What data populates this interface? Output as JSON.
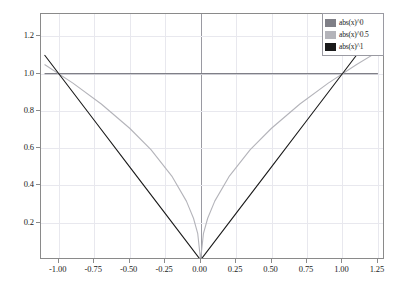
{
  "chart_data": {
    "type": "line",
    "title": "",
    "xlabel": "",
    "ylabel": "",
    "xlim": [
      -1.125,
      1.3
    ],
    "ylim": [
      0.0,
      1.32
    ],
    "grid": true,
    "legend_position": "top-right",
    "x_ticks": [
      "-1.00",
      "-0.75",
      "-0.50",
      "-0.25",
      "0.00",
      "0.25",
      "0.50",
      "0.75",
      "1.00",
      "1.25"
    ],
    "x_tick_values": [
      -1.0,
      -0.75,
      -0.5,
      -0.25,
      0.0,
      0.25,
      0.5,
      0.75,
      1.0,
      1.25
    ],
    "y_ticks": [
      "0.2",
      "0.4",
      "0.6",
      "0.8",
      "1.0",
      "1.2"
    ],
    "y_tick_values": [
      0.2,
      0.4,
      0.6,
      0.8,
      1.0,
      1.2
    ],
    "series": [
      {
        "name": "abs(x)^0",
        "color": "#7f7f87",
        "x": [
          -1.1,
          -0.75,
          -0.5,
          -0.25,
          0.0,
          0.25,
          0.5,
          0.75,
          1.1,
          1.25
        ],
        "values": [
          1.0,
          1.0,
          1.0,
          1.0,
          1.0,
          1.0,
          1.0,
          1.0,
          1.0,
          1.0
        ]
      },
      {
        "name": "abs(x)^0.5",
        "color": "#b4b4ba",
        "x": [
          -1.1,
          -0.9,
          -0.7,
          -0.5,
          -0.35,
          -0.2,
          -0.1,
          -0.05,
          -0.02,
          0.0,
          0.02,
          0.05,
          0.1,
          0.2,
          0.35,
          0.5,
          0.7,
          0.9,
          1.1,
          1.25
        ],
        "values": [
          1.049,
          0.949,
          0.837,
          0.707,
          0.592,
          0.447,
          0.316,
          0.224,
          0.141,
          0.0,
          0.141,
          0.224,
          0.316,
          0.447,
          0.592,
          0.707,
          0.837,
          0.949,
          1.049,
          1.118
        ]
      },
      {
        "name": "abs(x)^1",
        "color": "#1a1a1a",
        "x": [
          -1.1,
          -0.75,
          -0.5,
          -0.25,
          0.0,
          0.25,
          0.5,
          0.75,
          1.1,
          1.25
        ],
        "values": [
          1.1,
          0.75,
          0.5,
          0.25,
          0.0,
          0.25,
          0.5,
          0.75,
          1.1,
          1.25
        ]
      }
    ]
  },
  "legend": {
    "entries": [
      {
        "label": "abs(x)^0",
        "color": "#7f7f87"
      },
      {
        "label": "abs(x)^0.5",
        "color": "#b4b4ba"
      },
      {
        "label": "abs(x)^1",
        "color": "#1a1a1a"
      }
    ]
  },
  "colors": {
    "frame": "#8a8a8a",
    "grid": "#e8e8ee",
    "axis": "#9a9aa2",
    "background": "#ffffff",
    "text": "#1a1a1a"
  }
}
